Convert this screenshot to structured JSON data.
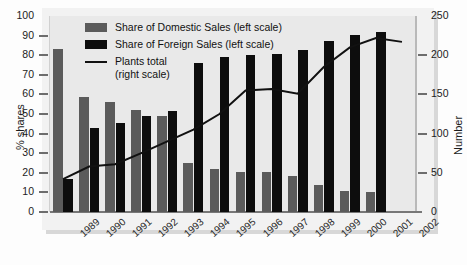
{
  "chart_data": {
    "type": "bar",
    "title": "",
    "xlabel": "",
    "ylabel": "% shares",
    "ylabel_right": "Number",
    "ylim": [
      0,
      100
    ],
    "ylim_right": [
      0,
      250
    ],
    "grid": false,
    "legend_position": "top-left",
    "categories": [
      "1989",
      "1990",
      "1991",
      "1992",
      "1993",
      "1994",
      "1995",
      "1996",
      "1997",
      "1998",
      "1999",
      "2000",
      "2001",
      "2002"
    ],
    "yticks": [
      "0",
      "10",
      "20",
      "30",
      "40",
      "50",
      "60",
      "70",
      "80",
      "90",
      "100"
    ],
    "yticks_right": [
      "0",
      "50",
      "100",
      "150",
      "200",
      "250"
    ],
    "series": [
      {
        "name": "Share of Domestic Sales (left scale)",
        "type": "bar",
        "axis": "left",
        "color": "#5b5b5b",
        "values": [
          83,
          58.5,
          56,
          52,
          49,
          25,
          22,
          20.5,
          20.5,
          18.5,
          14,
          10.5,
          10,
          null
        ]
      },
      {
        "name": "Share of Foreign Sales (left scale)",
        "type": "bar",
        "axis": "left",
        "color": "#0d0d0d",
        "values": [
          17,
          43,
          45.5,
          49,
          51.5,
          76,
          79,
          80,
          80.5,
          82.5,
          87.5,
          90.5,
          92,
          null
        ]
      },
      {
        "name": "Plants total (right scale)",
        "type": "line",
        "axis": "right",
        "color": "#111111",
        "values": [
          42,
          58,
          61,
          75,
          90,
          105,
          125,
          155,
          157,
          151,
          185,
          210,
          222,
          217
        ]
      }
    ]
  },
  "legend": {
    "entries": [
      {
        "label": "Share of Domestic Sales (left scale)",
        "marker": "swatch",
        "color": "#5b5b5b"
      },
      {
        "label": "Share of Foreign Sales (left scale)",
        "marker": "swatch",
        "color": "#0d0d0d"
      },
      {
        "label": "Plants total",
        "sublabel": "(right scale)",
        "marker": "line",
        "color": "#111111"
      }
    ]
  }
}
